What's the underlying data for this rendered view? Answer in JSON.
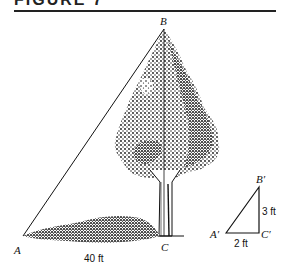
{
  "figure": {
    "header": "FIGURE 7"
  },
  "diagram": {
    "large_triangle": {
      "vertices": {
        "A": {
          "label": "A"
        },
        "B": {
          "label": "B"
        },
        "C": {
          "label": "C"
        }
      },
      "base_label": "40 ft"
    },
    "small_triangle": {
      "vertices": {
        "A_prime": {
          "label": "A′"
        },
        "B_prime": {
          "label": "B′"
        },
        "C_prime": {
          "label": "C′"
        }
      },
      "height_label": "3 ft",
      "base_label": "2 ft"
    },
    "colors": {
      "ink": "#111111",
      "background": "#ffffff"
    }
  }
}
